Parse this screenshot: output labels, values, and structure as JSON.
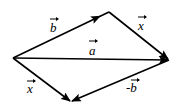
{
  "diagram": {
    "type": "vector-parallelogram",
    "stroke_color": "#000000",
    "background": "#ffffff",
    "points": {
      "origin": [
        13,
        58
      ],
      "top": [
        109,
        12
      ],
      "right": [
        169,
        60
      ],
      "bottom": [
        71,
        102
      ]
    },
    "vectors": [
      {
        "id": "b",
        "label": "b",
        "from": "origin",
        "to": "top",
        "arrow_at": 0.88
      },
      {
        "id": "x_upper",
        "label": "x",
        "from": "top",
        "to": "right",
        "arrow_at": 1.0
      },
      {
        "id": "a",
        "label": "a",
        "from": "origin",
        "to": "right",
        "arrow_at": 1.0
      },
      {
        "id": "x_lower",
        "label": "x",
        "from": "origin",
        "to": "bottom",
        "arrow_at": 1.0
      },
      {
        "id": "neg_b",
        "label": "-b",
        "from": "right",
        "to": "bottom",
        "arrow_at": 1.0
      }
    ],
    "labels": {
      "b": "b",
      "x_upper": "x",
      "a": "a",
      "x_lower": "x",
      "neg_b": "-b"
    }
  }
}
